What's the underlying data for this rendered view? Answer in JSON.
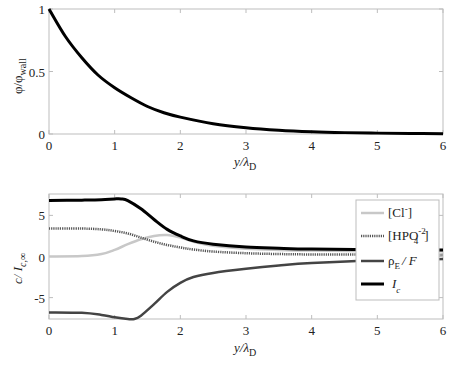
{
  "chart_data": [
    {
      "type": "line",
      "panel": "top",
      "title": "",
      "xlabel": "y/λD",
      "ylabel": "φ/φwall",
      "xlim": [
        0,
        6
      ],
      "ylim": [
        0,
        1
      ],
      "xticks": [
        0,
        1,
        2,
        3,
        4,
        5,
        6
      ],
      "yticks": [
        0,
        0.5,
        1
      ],
      "grid": false,
      "legend": null,
      "series": [
        {
          "name": "φ/φwall",
          "color": "#000000",
          "style": "solid",
          "x": [
            0,
            0.25,
            0.5,
            0.75,
            1,
            1.25,
            1.5,
            1.75,
            2,
            2.5,
            3,
            3.5,
            4,
            4.5,
            5,
            5.5,
            6
          ],
          "y": [
            1.0,
            0.78,
            0.61,
            0.47,
            0.37,
            0.29,
            0.22,
            0.17,
            0.135,
            0.082,
            0.05,
            0.03,
            0.018,
            0.011,
            0.007,
            0.004,
            0.002
          ]
        }
      ]
    },
    {
      "type": "line",
      "panel": "bottom",
      "title": "",
      "xlabel": "y/λD",
      "ylabel": "c/ Ic,∞",
      "xlim": [
        0,
        6
      ],
      "ylim": [
        -7.6,
        7.6
      ],
      "xticks": [
        0,
        1,
        2,
        3,
        4,
        5,
        6
      ],
      "yticks": [
        -5,
        0,
        5
      ],
      "grid": false,
      "legend": {
        "position": "upper right",
        "entries": [
          "[Cl⁻]",
          "[HPO₄⁻²]",
          "ρE / F",
          "Ic"
        ]
      },
      "series": [
        {
          "name": "[Cl-]",
          "color": "#c8c8c8",
          "style": "solid",
          "x": [
            0,
            0.5,
            0.8,
            1.0,
            1.2,
            1.4,
            1.6,
            1.8,
            2.0,
            2.2,
            2.5,
            3,
            3.5,
            4,
            5,
            6
          ],
          "y": [
            0,
            0.05,
            0.3,
            0.8,
            1.5,
            2.1,
            2.5,
            2.6,
            2.3,
            1.8,
            1.3,
            0.95,
            0.8,
            0.72,
            0.66,
            0.64
          ]
        },
        {
          "name": "[HPO4-2]",
          "color": "#555555",
          "style": "dotted",
          "x": [
            0,
            0.5,
            0.8,
            1.0,
            1.2,
            1.4,
            1.6,
            1.8,
            2.0,
            2.2,
            2.5,
            3,
            3.5,
            4,
            5,
            6
          ],
          "y": [
            3.4,
            3.4,
            3.3,
            3.1,
            2.8,
            2.3,
            1.8,
            1.4,
            1.1,
            0.85,
            0.6,
            0.4,
            0.3,
            0.25,
            0.22,
            0.2
          ]
        },
        {
          "name": "ρE/F",
          "color": "#444444",
          "style": "dashed",
          "x": [
            0,
            0.5,
            0.8,
            1.0,
            1.2,
            1.3,
            1.4,
            1.6,
            1.8,
            2.0,
            2.2,
            2.5,
            3,
            3.5,
            4,
            5,
            6
          ],
          "y": [
            -6.8,
            -6.85,
            -7.1,
            -7.4,
            -7.6,
            -7.6,
            -7.2,
            -5.8,
            -4.3,
            -3.2,
            -2.5,
            -2.0,
            -1.5,
            -1.1,
            -0.8,
            -0.45,
            -0.3
          ]
        },
        {
          "name": "Ic",
          "color": "#000000",
          "style": "solid",
          "x": [
            0,
            0.5,
            0.8,
            1.0,
            1.1,
            1.2,
            1.4,
            1.6,
            1.8,
            2.0,
            2.2,
            2.5,
            3,
            3.5,
            4,
            5,
            6
          ],
          "y": [
            6.8,
            6.85,
            6.9,
            7.0,
            7.0,
            6.8,
            5.8,
            4.5,
            3.3,
            2.5,
            1.9,
            1.5,
            1.15,
            1.0,
            0.9,
            0.82,
            0.8
          ]
        }
      ]
    }
  ],
  "top_panel": {
    "ylabel_main": "φ/φ",
    "ylabel_sub": "wall",
    "xlabel_main": "y/λ",
    "xlabel_sub": "D",
    "xtick_labels": [
      "0",
      "1",
      "2",
      "3",
      "4",
      "5",
      "6"
    ],
    "ytick_labels": [
      "0",
      "0.5",
      "1"
    ]
  },
  "bottom_panel": {
    "ylabel_main": "c/ I",
    "ylabel_sub": "c,∞",
    "xlabel_main": "y/λ",
    "xlabel_sub": "D",
    "xtick_labels": [
      "0",
      "1",
      "2",
      "3",
      "4",
      "5",
      "6"
    ],
    "ytick_labels": [
      "-5",
      "0",
      "5"
    ],
    "legend": {
      "cl": {
        "main": "[Cl",
        "sup": "-",
        "tail": "]"
      },
      "hpo": {
        "main": "[HPO",
        "sub": "4",
        "sup": "-2",
        "tail": "]"
      },
      "rho": {
        "main": "ρ",
        "sub": "E",
        "tail": "/ F"
      },
      "ic": {
        "main": "I",
        "sub": "c"
      }
    }
  }
}
